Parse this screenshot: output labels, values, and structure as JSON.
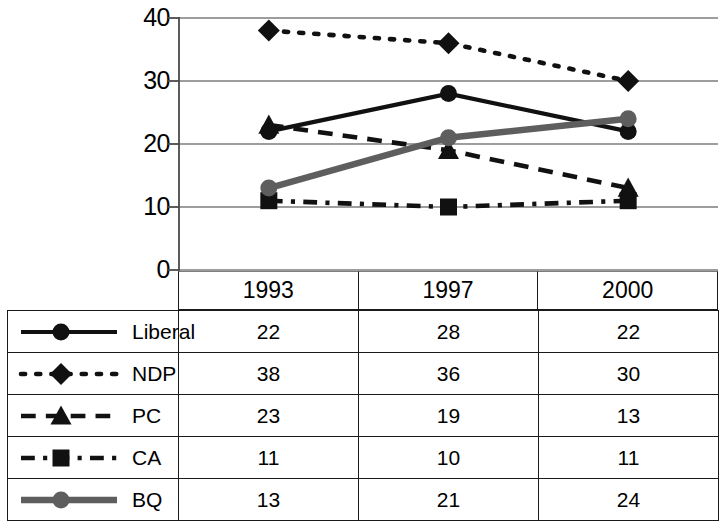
{
  "chart_data": {
    "type": "line",
    "title": "",
    "xlabel": "",
    "ylabel": "",
    "categories": [
      "1993",
      "1997",
      "2000"
    ],
    "ylim": [
      0,
      40
    ],
    "yticks": [
      0,
      10,
      20,
      30,
      40
    ],
    "grid": true,
    "legend_position": "table-left-column",
    "series": [
      {
        "name": "Liberal",
        "values": [
          22,
          28,
          22
        ],
        "line_style": "solid",
        "marker": "circle",
        "color": "#111111"
      },
      {
        "name": "NDP",
        "values": [
          38,
          36,
          30
        ],
        "line_style": "dotted",
        "marker": "diamond",
        "color": "#111111"
      },
      {
        "name": "PC",
        "values": [
          23,
          19,
          13
        ],
        "line_style": "dashed",
        "marker": "triangle",
        "color": "#111111"
      },
      {
        "name": "CA",
        "values": [
          11,
          10,
          11
        ],
        "line_style": "dashdot",
        "marker": "square",
        "color": "#111111"
      },
      {
        "name": "BQ",
        "values": [
          13,
          21,
          24
        ],
        "line_style": "solid",
        "marker": "circle",
        "color": "#5e5e5e"
      }
    ]
  },
  "axis": {
    "y_tick_labels": [
      "40",
      "30",
      "20",
      "10",
      "0"
    ]
  },
  "table": {
    "year_headers": [
      "1993",
      "1997",
      "2000"
    ],
    "rows": [
      {
        "label": "Liberal",
        "values": [
          "22",
          "28",
          "22"
        ]
      },
      {
        "label": "NDP",
        "values": [
          "38",
          "36",
          "30"
        ]
      },
      {
        "label": "PC",
        "values": [
          "23",
          "19",
          "13"
        ]
      },
      {
        "label": "CA",
        "values": [
          "11",
          "10",
          "11"
        ]
      },
      {
        "label": "BQ",
        "values": [
          "13",
          "21",
          "24"
        ]
      }
    ]
  },
  "colors": {
    "gridline": "#7d7d7d",
    "axis": "#4a4a4a",
    "series_black": "#111111",
    "series_gray": "#5e5e5e",
    "table_border": "#1a1a1a"
  }
}
